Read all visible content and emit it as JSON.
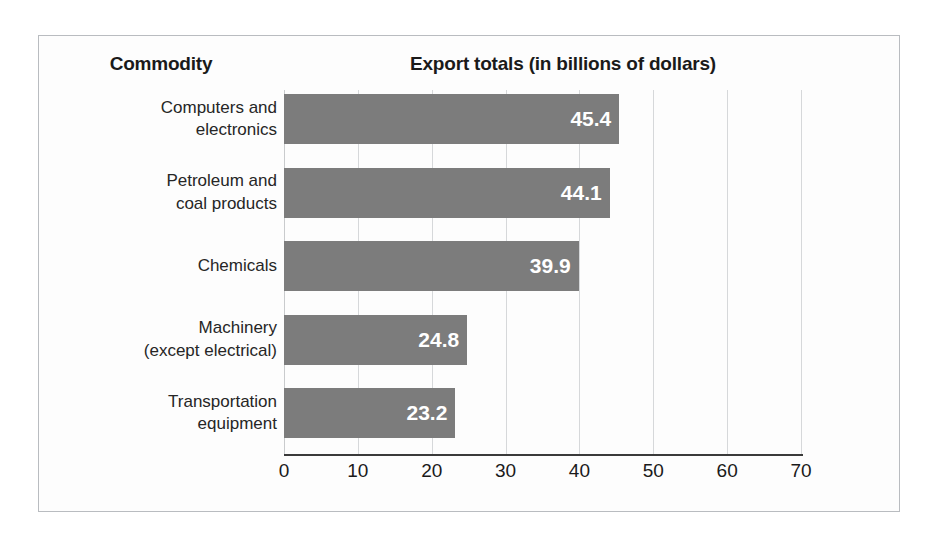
{
  "headers": {
    "commodity": "Commodity",
    "export": "Export totals (in billions of dollars)"
  },
  "colors": {
    "bar": "#7c7c7c",
    "bar_label": "#ffffff",
    "gridline": "#d6d8da",
    "axis": "#3a3a3a",
    "frame": "#b9bcc0",
    "background": "#fdfdfd"
  },
  "chart_data": {
    "type": "bar",
    "orientation": "horizontal",
    "title": "Export totals (in billions of dollars)",
    "xlabel": "",
    "ylabel": "Commodity",
    "categories": [
      "Computers and electronics",
      "Petroleum and coal products",
      "Chemicals",
      "Machinery (except electrical)",
      "Transportation equipment"
    ],
    "category_lines": [
      [
        "Computers and",
        "electronics"
      ],
      [
        "Petroleum and",
        "coal products"
      ],
      [
        "Chemicals"
      ],
      [
        "Machinery",
        "(except electrical)"
      ],
      [
        "Transportation",
        "equipment"
      ]
    ],
    "values": [
      45.4,
      44.1,
      39.9,
      24.8,
      23.2
    ],
    "value_labels": [
      "45.4",
      "44.1",
      "39.9",
      "24.8",
      "23.2"
    ],
    "xlim": [
      0,
      70
    ],
    "xticks": [
      0,
      10,
      20,
      30,
      40,
      50,
      60,
      70
    ],
    "xtick_labels": [
      "0",
      "10",
      "20",
      "30",
      "40",
      "50",
      "60",
      "70"
    ],
    "grid": true,
    "grid_axis": "x",
    "legend": false,
    "units": "billions of dollars"
  }
}
